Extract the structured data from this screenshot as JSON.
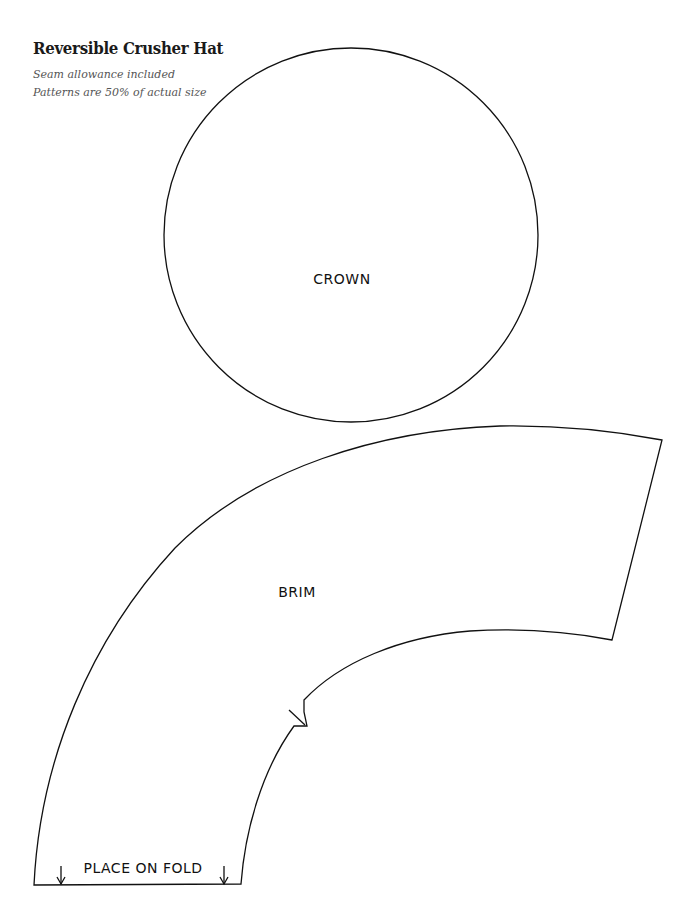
{
  "header": {
    "title": "Reversible Crusher Hat",
    "notes": [
      "Seam allowance included",
      "Patterns are 50% of actual size"
    ]
  },
  "pieces": {
    "crown": {
      "label": "CROWN",
      "shape": "circle"
    },
    "brim": {
      "label": "BRIM",
      "shape": "curved-band"
    }
  },
  "annotations": {
    "fold_label": "PLACE ON FOLD",
    "fold_arrows": 2,
    "notch_marks": 1
  },
  "colors": {
    "line": "#111111",
    "note_text": "#555555",
    "background": "#ffffff"
  }
}
